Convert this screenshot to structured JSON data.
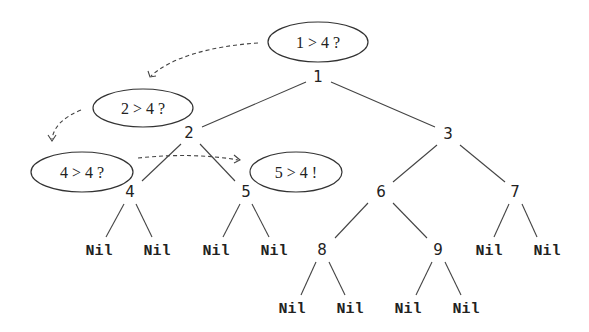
{
  "diagram": {
    "type": "binary-tree-search-trace",
    "nodes": [
      {
        "id": "1",
        "label": "1",
        "x": 318,
        "y": 77
      },
      {
        "id": "2",
        "label": "2",
        "x": 189,
        "y": 133
      },
      {
        "id": "3",
        "label": "3",
        "x": 448,
        "y": 134
      },
      {
        "id": "4",
        "label": "4",
        "x": 130,
        "y": 192
      },
      {
        "id": "5",
        "label": "5",
        "x": 246,
        "y": 192
      },
      {
        "id": "6",
        "label": "6",
        "x": 381,
        "y": 192
      },
      {
        "id": "7",
        "label": "7",
        "x": 515,
        "y": 192
      },
      {
        "id": "8",
        "label": "8",
        "x": 322,
        "y": 250
      },
      {
        "id": "9",
        "label": "9",
        "x": 438,
        "y": 250
      }
    ],
    "nil_leaves": [
      {
        "parent": "4",
        "label": "Nil",
        "x": 99,
        "y": 250
      },
      {
        "parent": "4",
        "label": "Nil",
        "x": 157,
        "y": 250
      },
      {
        "parent": "5",
        "label": "Nil",
        "x": 216,
        "y": 250
      },
      {
        "parent": "5",
        "label": "Nil",
        "x": 274,
        "y": 250
      },
      {
        "parent": "7",
        "label": "Nil",
        "x": 489,
        "y": 250
      },
      {
        "parent": "7",
        "label": "Nil",
        "x": 547,
        "y": 250
      },
      {
        "parent": "8",
        "label": "Nil",
        "x": 292,
        "y": 308
      },
      {
        "parent": "8",
        "label": "Nil",
        "x": 350,
        "y": 308
      },
      {
        "parent": "9",
        "label": "Nil",
        "x": 408,
        "y": 308
      },
      {
        "parent": "9",
        "label": "Nil",
        "x": 466,
        "y": 308
      }
    ],
    "edges": [
      {
        "from": "1",
        "to": "2"
      },
      {
        "from": "1",
        "to": "3"
      },
      {
        "from": "2",
        "to": "4"
      },
      {
        "from": "2",
        "to": "5"
      },
      {
        "from": "3",
        "to": "6"
      },
      {
        "from": "3",
        "to": "7"
      },
      {
        "from": "6",
        "to": "8"
      },
      {
        "from": "6",
        "to": "9"
      },
      {
        "from": "4",
        "to": "Nil"
      },
      {
        "from": "4",
        "to": "Nil"
      },
      {
        "from": "5",
        "to": "Nil"
      },
      {
        "from": "5",
        "to": "Nil"
      },
      {
        "from": "7",
        "to": "Nil"
      },
      {
        "from": "7",
        "to": "Nil"
      },
      {
        "from": "8",
        "to": "Nil"
      },
      {
        "from": "8",
        "to": "Nil"
      },
      {
        "from": "9",
        "to": "Nil"
      },
      {
        "from": "9",
        "to": "Nil"
      }
    ],
    "comparisons": [
      {
        "node": "1",
        "label": "1 > 4 ?",
        "cx": 318,
        "cy": 42,
        "rx": 50,
        "ry": 20
      },
      {
        "node": "2",
        "label": "2 > 4 ?",
        "cx": 143,
        "cy": 108,
        "rx": 50,
        "ry": 19
      },
      {
        "node": "4",
        "label": "4 > 4 ?",
        "cx": 82,
        "cy": 172,
        "rx": 51,
        "ry": 20
      },
      {
        "node": "5",
        "label": "5 > 4 !",
        "cx": 296,
        "cy": 172,
        "rx": 46,
        "ry": 20
      }
    ],
    "trace_order": [
      "1 > 4 ?",
      "2 > 4 ?",
      "4 > 4 ?",
      "5 > 4 !"
    ]
  }
}
